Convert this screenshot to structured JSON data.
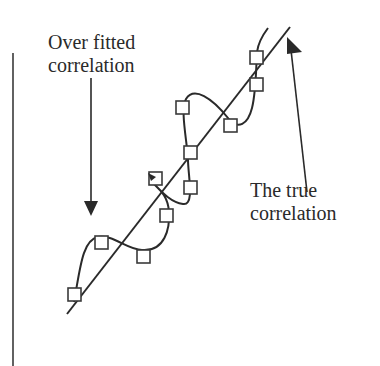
{
  "diagram": {
    "labels": {
      "overfit_line1": "Over fitted",
      "overfit_line2": "correlation",
      "true_line1": "The true",
      "true_line2": "correlation"
    },
    "colors": {
      "ink": "#2a2a2a",
      "background": "#ffffff",
      "square_fill": "#ffffff"
    },
    "axis": {
      "x": 13,
      "y_top": 53,
      "y_bottom": 366
    },
    "true_line": {
      "x1": 67,
      "y1": 314,
      "x2": 290,
      "y2": 27
    },
    "overfit_arrow": {
      "x": 91,
      "y_start": 78,
      "y_tip": 216
    },
    "true_arrow": {
      "x_start": 307,
      "y_start": 172,
      "x_tip": 288,
      "y_tip": 38
    },
    "data_points": [
      {
        "x": 74,
        "y": 294
      },
      {
        "x": 101,
        "y": 242
      },
      {
        "x": 143,
        "y": 256
      },
      {
        "x": 166,
        "y": 215
      },
      {
        "x": 155,
        "y": 178
      },
      {
        "x": 190,
        "y": 187
      },
      {
        "x": 190,
        "y": 152
      },
      {
        "x": 182,
        "y": 107
      },
      {
        "x": 230,
        "y": 125
      },
      {
        "x": 256,
        "y": 84
      },
      {
        "x": 256,
        "y": 57
      }
    ]
  }
}
